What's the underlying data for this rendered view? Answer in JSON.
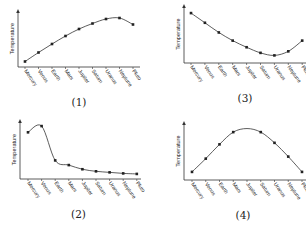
{
  "chart_data": [
    {
      "id": "chart-1",
      "caption": "(1)",
      "type": "line",
      "title": "",
      "xlabel": "",
      "ylabel": "Temperature",
      "categories": [
        "Mercury",
        "Venus",
        "Earth",
        "Mars",
        "Jupiter",
        "Saturn",
        "Uranus",
        "Neptune",
        "Pluto"
      ],
      "values": [
        5,
        23,
        40,
        56,
        70,
        81,
        90,
        92,
        79
      ],
      "markers": [
        true,
        true,
        true,
        true,
        true,
        true,
        true,
        true,
        true
      ],
      "ylim": [
        0,
        100
      ],
      "grid": false,
      "legend": null,
      "frame": {
        "x0": 18,
        "y_top": 10,
        "y_axis": 67,
        "x_right": 140,
        "x_start": 25,
        "x_step": 13.5
      }
    },
    {
      "id": "chart-2",
      "caption": "(2)",
      "type": "line",
      "title": "",
      "xlabel": "",
      "ylabel": "Temperature",
      "categories": [
        "Mercury",
        "Venus",
        "Earth",
        "Mars",
        "Jupiter",
        "Saturn",
        "Uranus",
        "Neptune",
        "Pluto"
      ],
      "values": [
        84,
        96,
        30,
        21,
        13,
        9,
        7,
        5,
        4
      ],
      "markers": [
        true,
        true,
        true,
        true,
        true,
        true,
        true,
        true,
        true
      ],
      "ylim": [
        0,
        100
      ],
      "grid": false,
      "legend": null,
      "frame": {
        "x0": 20,
        "y_top": 120,
        "y_axis": 179,
        "x_right": 141,
        "x_start": 28,
        "x_step": 13.6
      }
    },
    {
      "id": "chart-3",
      "caption": "(3)",
      "type": "line",
      "title": "",
      "xlabel": "",
      "ylabel": "Temperature",
      "categories": [
        "Mercury",
        "Venus",
        "Earth",
        "Mars",
        "Jupiter",
        "Saturn",
        "Uranus",
        "Neptune",
        "Pluto"
      ],
      "values": [
        92,
        73,
        54,
        38,
        25,
        14,
        9,
        17,
        38
      ],
      "markers": [
        true,
        true,
        true,
        true,
        true,
        true,
        true,
        true,
        true
      ],
      "ylim": [
        0,
        100
      ],
      "grid": false,
      "legend": null,
      "frame": {
        "x0": 184,
        "y_top": 5,
        "y_axis": 63,
        "x_right": 306,
        "x_start": 191,
        "x_step": 13.9
      }
    },
    {
      "id": "chart-4",
      "caption": "(4)",
      "type": "line",
      "title": "",
      "xlabel": "",
      "ylabel": "Temperature",
      "categories": [
        "Mercury",
        "Venus",
        "Earth",
        "Mars",
        "Jupiter",
        "Saturn",
        "Uranus",
        "Neptune",
        "Pluto"
      ],
      "values": [
        10,
        36,
        64,
        88,
        95,
        88,
        67,
        40,
        10
      ],
      "markers": [
        true,
        true,
        true,
        true,
        false,
        true,
        true,
        true,
        true
      ],
      "ylim": [
        0,
        100
      ],
      "grid": false,
      "legend": null,
      "frame": {
        "x0": 184,
        "y_top": 122,
        "y_axis": 180,
        "x_right": 306,
        "x_start": 192,
        "x_step": 13.75
      }
    }
  ]
}
